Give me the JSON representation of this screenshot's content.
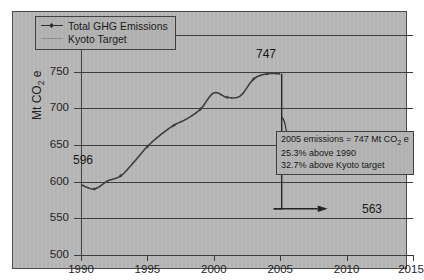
{
  "chart_data": {
    "type": "line",
    "title": "",
    "xlabel": "",
    "ylabel": "Mt CO2 e",
    "ylabel_rich": "Mt CO₂ e",
    "xlim": [
      1990,
      2015
    ],
    "ylim": [
      500,
      800
    ],
    "xticks": [
      1990,
      1995,
      2000,
      2005,
      2010,
      2015
    ],
    "yticks": [
      500,
      550,
      600,
      650,
      700,
      750,
      800
    ],
    "grid": "horizontal",
    "legend_position": "top-left",
    "legend": [
      "Total GHG Emissions",
      "Kyoto Target"
    ],
    "series": [
      {
        "name": "Total GHG Emissions",
        "x": [
          1990,
          1991,
          1992,
          1993,
          1994,
          1995,
          1996,
          1997,
          1998,
          1999,
          2000,
          2001,
          2002,
          2003,
          2004,
          2005
        ],
        "values": [
          596,
          590,
          601,
          608,
          627,
          648,
          664,
          677,
          686,
          699,
          721,
          715,
          717,
          740,
          747,
          747
        ]
      },
      {
        "name": "Kyoto Target",
        "x": [
          2005,
          2008,
          2012
        ],
        "values": [
          563,
          563,
          563
        ]
      }
    ],
    "annotations": [
      {
        "name": "start-value-label",
        "text": "596",
        "x": 1990,
        "y": 596
      },
      {
        "name": "peak-value-label",
        "text": "747",
        "x": 2005,
        "y": 747
      },
      {
        "name": "target-value-label",
        "text": "563",
        "x": 2011,
        "y": 563
      }
    ],
    "callout": {
      "line1": "2005 emissions = 747 Mt CO2 e",
      "line1_rich": "2005 emissions = 747 Mt CO₂ e",
      "line2": "25.3% above 1990",
      "line3": "32.7% above Kyoto target"
    },
    "colors": {
      "panel_background": "#b7b7b7",
      "axis": "#3b3b3b",
      "series_line": "#3a3a3a",
      "target_line": "#2b2b2b",
      "text": "#1d1d1d"
    }
  },
  "axis": {
    "ytick_labels": [
      "800",
      "750",
      "700",
      "650",
      "600",
      "550",
      "500"
    ],
    "xtick_labels": [
      "1990",
      "1995",
      "2000",
      "2005",
      "2010",
      "2015"
    ],
    "y_title": "Mt CO",
    "y_title_sub": "2",
    "y_title_tail": " e"
  },
  "legend": {
    "items": [
      {
        "label": "Total GHG Emissions",
        "marker": "line-diamond-marker"
      },
      {
        "label": "Kyoto Target",
        "marker": "line-plain-marker"
      }
    ]
  },
  "labels": {
    "start": "596",
    "peak": "747",
    "target": "563"
  },
  "callout": {
    "line1_pre": "2005 emissions = 747 Mt CO",
    "line1_sub": "2",
    "line1_post": " e",
    "line2": "25.3% above 1990",
    "line3": "32.7% above Kyoto target"
  }
}
